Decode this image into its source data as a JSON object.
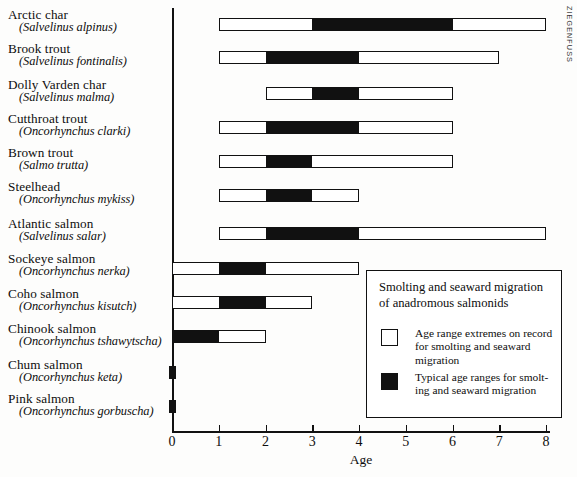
{
  "credit": "ZIEGENFUSS",
  "chart_data": {
    "type": "bar",
    "orientation": "horizontal",
    "title": "Smolting and seaward migration of anadromous salmonids",
    "xlabel": "Age",
    "ylabel": "",
    "xlim": [
      0,
      8
    ],
    "xticks": [
      0,
      1,
      2,
      3,
      4,
      5,
      6,
      7,
      8
    ],
    "xtick_labels": [
      "0",
      "1",
      "2",
      "3",
      "4",
      "5",
      "6",
      "7",
      "8"
    ],
    "grid": false,
    "legend_position": "lower-right",
    "series": [
      {
        "name": "Age range extremes on record for smolting and seaward migration",
        "style": "open",
        "values": [
          [
            1,
            8
          ],
          [
            1,
            7
          ],
          [
            2,
            6
          ],
          [
            1,
            6
          ],
          [
            1,
            6
          ],
          [
            1,
            4
          ],
          [
            1,
            8
          ],
          [
            0,
            4
          ],
          [
            0,
            3
          ],
          [
            0,
            2
          ],
          [
            0,
            0.12
          ],
          [
            0,
            0.12
          ]
        ]
      },
      {
        "name": "Typical age ranges for smolting and seaward migration",
        "style": "filled",
        "values": [
          [
            3,
            6
          ],
          [
            2,
            4
          ],
          [
            3,
            4
          ],
          [
            2,
            4
          ],
          [
            2,
            3
          ],
          [
            2,
            3
          ],
          [
            2,
            4
          ],
          [
            1,
            2
          ],
          [
            1,
            2
          ],
          [
            0,
            1
          ],
          [
            0,
            0.12
          ],
          [
            0,
            0.12
          ]
        ]
      }
    ],
    "categories": [
      "Arctic char",
      "Brook trout",
      "Dolly Varden char",
      "Cutthroat trout",
      "Brown trout",
      "Steelhead",
      "Atlantic salmon",
      "Sockeye salmon",
      "Coho salmon",
      "Chinook salmon",
      "Chum salmon",
      "Pink salmon"
    ]
  },
  "species": [
    {
      "common": "Arctic char",
      "scientific": "(Salvelinus alpinus)"
    },
    {
      "common": "Brook trout",
      "scientific": "(Salvelinus fontinalis)"
    },
    {
      "common": "Dolly Varden char",
      "scientific": "(Salvelinus malma)"
    },
    {
      "common": "Cutthroat trout",
      "scientific": "(Oncorhynchus clarki)"
    },
    {
      "common": "Brown trout",
      "scientific": "(Salmo trutta)"
    },
    {
      "common": "Steelhead",
      "scientific": "(Oncorhynchus mykiss)"
    },
    {
      "common": "Atlantic salmon",
      "scientific": "(Salvelinus salar)"
    },
    {
      "common": "Sockeye salmon",
      "scientific": "(Oncorhynchus nerka)"
    },
    {
      "common": "Coho salmon",
      "scientific": "(Oncorhynchus kisutch)"
    },
    {
      "common": "Chinook salmon",
      "scientific": "(Oncorhynchus tshawytscha)"
    },
    {
      "common": "Chum salmon",
      "scientific": "(Oncorhynchus keta)"
    },
    {
      "common": "Pink salmon",
      "scientific": "(Oncorhynchus gorbuscha)"
    }
  ],
  "legend": {
    "title_line1": "Smolting and seaward migration",
    "title_line2": "of anadromous salmonids",
    "entries": [
      {
        "swatch": "open",
        "text": "Age range extremes on record for smolting and seaward migration"
      },
      {
        "swatch": "filled",
        "text": "Typical age ranges for smolt-ing and seaward migration"
      }
    ]
  },
  "axis": {
    "title": "Age",
    "ticks": [
      "0",
      "1",
      "2",
      "3",
      "4",
      "5",
      "6",
      "7",
      "8"
    ]
  }
}
